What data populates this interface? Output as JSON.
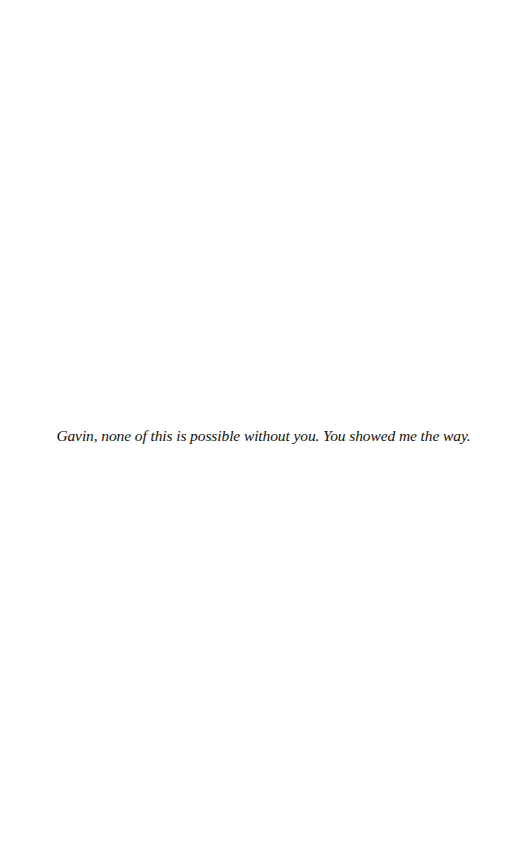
{
  "page": {
    "type": "dedication",
    "background_color": "#ffffff",
    "text_color": "#111111",
    "dedication_text": "Gavin, none of this is possible without you. You showed me the way."
  }
}
